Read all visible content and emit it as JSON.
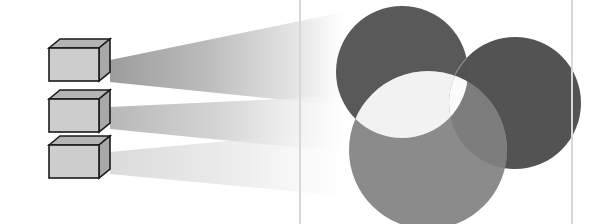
{
  "figure": {
    "name": "projection-beams-and-venn-circles",
    "width": 611,
    "height": 224,
    "background_color": "#ffffff",
    "visible_text": []
  },
  "frame": {
    "name": "rounded-panel-border",
    "stroke_color": "#d8d8d8",
    "stroke_width": 2,
    "corner_radius": 18,
    "x": 300,
    "y": -30,
    "width": 272,
    "height": 282
  },
  "boxes": {
    "count": 3,
    "front_face_color": "#cdcdcd",
    "top_face_color": "#b4b4b4",
    "side_face_color": "#a8a8a8",
    "outline_color": "#1a1a1a",
    "outline_width": 1.6,
    "depth_x": 11,
    "depth_y": -9,
    "items": [
      {
        "label": "box-1",
        "x": 49,
        "y": 48,
        "width": 50,
        "height": 33
      },
      {
        "label": "box-2",
        "x": 49,
        "y": 99,
        "width": 50,
        "height": 33
      },
      {
        "label": "box-3",
        "x": 49,
        "y": 145,
        "width": 50,
        "height": 33
      }
    ]
  },
  "beams": {
    "count": 3,
    "gradient_start_color": "#9a9a9a",
    "gradient_mid_color": "#c4c4c4",
    "gradient_end_color": "#ffffff",
    "items": [
      {
        "label": "beam-1",
        "near_x": 110,
        "near_top_y": 60,
        "near_bottom_y": 82,
        "far_x": 344,
        "far_top_y": 12,
        "far_bottom_y": 106,
        "opacity": 0.95
      },
      {
        "label": "beam-2",
        "near_x": 110,
        "near_top_y": 107,
        "near_bottom_y": 129,
        "far_x": 344,
        "far_top_y": 96,
        "far_bottom_y": 152,
        "opacity": 0.8
      },
      {
        "label": "beam-3",
        "near_x": 110,
        "near_top_y": 152,
        "near_bottom_y": 174,
        "far_x": 344,
        "far_top_y": 130,
        "far_bottom_y": 196,
        "opacity": 0.55
      }
    ]
  },
  "circles": {
    "count": 3,
    "items": [
      {
        "label": "circle-top-left",
        "role": "dark-left",
        "cx": 402,
        "cy": 72,
        "r": 66,
        "fill_color": "#595959"
      },
      {
        "label": "circle-top-right",
        "role": "dark-right",
        "cx": 515,
        "cy": 103,
        "r": 66,
        "fill_color": "#535353"
      },
      {
        "label": "circle-bottom",
        "role": "light-bottom",
        "cx": 428,
        "cy": 150,
        "r": 79,
        "fill_color": "#8b8b8b"
      }
    ],
    "overlaps": [
      {
        "label": "overlap-dark-left-dark-right",
        "fill_color": "#525252",
        "edge_stroke_color": "#8f8f8f"
      },
      {
        "label": "overlap-dark-left-light-bottom",
        "fill_color": "#f2f2f2"
      },
      {
        "label": "overlap-dark-right-light-bottom",
        "fill_color": "#7d7d7d"
      },
      {
        "label": "overlap-all-three",
        "fill_color": "#fbfbfb"
      }
    ]
  }
}
